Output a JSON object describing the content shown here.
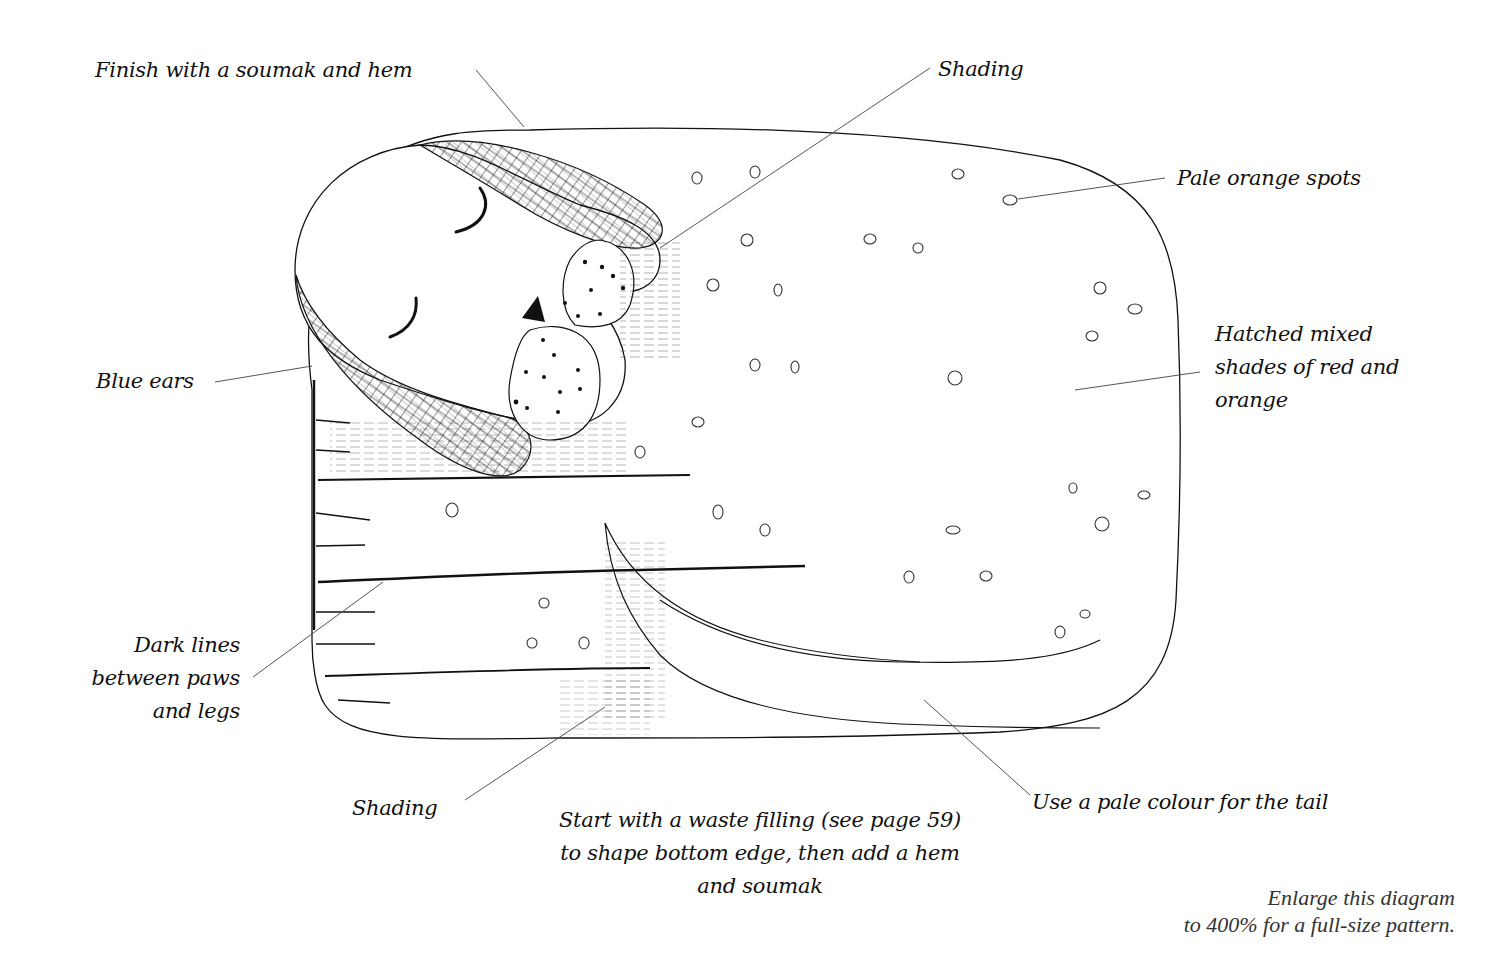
{
  "diagram": {
    "colors": {
      "ink": "#111111",
      "leader_line": "#555555",
      "background": "#ffffff"
    },
    "labels": {
      "finish": "Finish with a soumak and hem",
      "shading_top": "Shading",
      "spots": "Pale orange spots",
      "body_lines": [
        "Hatched mixed",
        "shades of red and",
        "orange"
      ],
      "ears": "Blue ears",
      "dark_lines": [
        "Dark lines",
        "between paws",
        "and legs"
      ],
      "shading_bottom": "Shading",
      "start_lines": [
        "Start with a waste filling (see page 59)",
        "to shape bottom edge, then add a hem",
        "and soumak"
      ],
      "tail": "Use a pale colour for the tail"
    },
    "note": {
      "lines": [
        "Enlarge this diagram",
        "to 400% for a full-size pattern."
      ]
    }
  }
}
